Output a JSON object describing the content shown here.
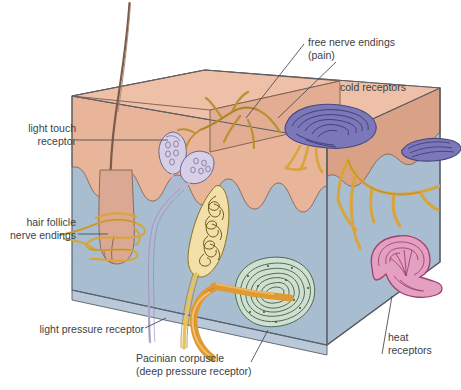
{
  "figure": {
    "type": "anatomical-diagram",
    "text_color": "#3b3f46"
  },
  "labels": {
    "light_touch": "light touch\nreceptor",
    "hair_follicle": "hair follicle\nnerve endings",
    "light_pressure": "light pressure receptor",
    "pacinian": "Pacinian corpuscle\n(deep pressure receptor)",
    "free_nerve": "free nerve endings\n(pain)",
    "cold": "cold receptors",
    "heat": "heat\nreceptors"
  },
  "structures": [
    {
      "name": "epidermis",
      "color": "#e8b49a"
    },
    {
      "name": "epidermis-top-surface",
      "color": "#eec0a8"
    },
    {
      "name": "epidermis-right-face",
      "color": "#d9a287"
    },
    {
      "name": "dermis",
      "color": "#a9bdd1"
    },
    {
      "name": "dermis-bottom-face",
      "color": "#b9c9d9"
    },
    {
      "name": "hair-shaft",
      "color": "#7a5c4a"
    },
    {
      "name": "hair-follicle",
      "color": "#dba894"
    },
    {
      "name": "light-touch-receptor",
      "color": "#d6cfe6"
    },
    {
      "name": "light-pressure-receptor",
      "color": "#f2e0a8"
    },
    {
      "name": "pacinian-corpuscle",
      "color": "#cfe0d0"
    },
    {
      "name": "cold-receptor",
      "color": "#7b77b8"
    },
    {
      "name": "heat-receptor",
      "color": "#e3a0c0"
    },
    {
      "name": "nerve-fiber-gold",
      "color": "#e8a93c"
    },
    {
      "name": "nerve-fiber-olive",
      "color": "#b89234"
    },
    {
      "name": "nerve-fiber-lavender",
      "color": "#bdb3d6"
    }
  ]
}
